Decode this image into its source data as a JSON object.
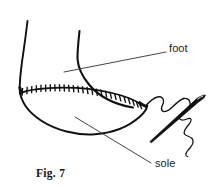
{
  "figure": {
    "caption": "Fig. 7",
    "ink_color": "#111111",
    "background_color": "#ffffff",
    "leader_line_color": "#3a3a3a",
    "labels": [
      {
        "id": "foot",
        "text": "foot",
        "points_to": "upper shoe / foot form",
        "leader_from_x": 64,
        "leader_from_y": 72,
        "leader_to_x": 166,
        "leader_to_y": 52
      },
      {
        "id": "sole",
        "text": "sole",
        "points_to": "underside sole panel",
        "leader_from_x": 75,
        "leader_from_y": 117,
        "leader_to_x": 150,
        "leader_to_y": 163
      }
    ],
    "elements": [
      {
        "name": "shoe-upper-left-edge",
        "type": "curve"
      },
      {
        "name": "shoe-upper-center-edge",
        "type": "curve"
      },
      {
        "name": "seam-line",
        "type": "curve"
      },
      {
        "name": "seam-stitch-ticks",
        "type": "ticks",
        "count": 27
      },
      {
        "name": "sole-outline",
        "type": "curve"
      },
      {
        "name": "needle",
        "type": "shape"
      },
      {
        "name": "thread",
        "type": "curve"
      }
    ]
  }
}
